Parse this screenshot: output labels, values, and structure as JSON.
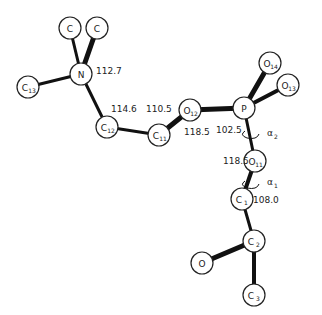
{
  "diagram": {
    "type": "molecular-structure",
    "atoms": [
      {
        "id": "Ca",
        "label": "C",
        "sub": "",
        "x": 70,
        "y": 28
      },
      {
        "id": "Cb",
        "label": "C",
        "sub": "",
        "x": 97,
        "y": 28
      },
      {
        "id": "N",
        "label": "N",
        "sub": "",
        "x": 81,
        "y": 74
      },
      {
        "id": "C13",
        "label": "C",
        "sub": "13",
        "x": 28,
        "y": 87
      },
      {
        "id": "C12",
        "label": "C",
        "sub": "12",
        "x": 107,
        "y": 127
      },
      {
        "id": "C11",
        "label": "C",
        "sub": "11",
        "x": 159,
        "y": 135
      },
      {
        "id": "O12",
        "label": "O",
        "sub": "12",
        "x": 190,
        "y": 110
      },
      {
        "id": "P",
        "label": "P",
        "sub": "",
        "x": 244,
        "y": 108
      },
      {
        "id": "O14",
        "label": "O",
        "sub": "14",
        "x": 270,
        "y": 63
      },
      {
        "id": "O13",
        "label": "O",
        "sub": "13",
        "x": 288,
        "y": 85
      },
      {
        "id": "O11",
        "label": "O",
        "sub": "11",
        "x": 255,
        "y": 161
      },
      {
        "id": "C1",
        "label": "C",
        "sub": "1",
        "x": 242,
        "y": 199
      },
      {
        "id": "C2",
        "label": "C",
        "sub": "2",
        "x": 254,
        "y": 241
      },
      {
        "id": "O",
        "label": "O",
        "sub": "",
        "x": 202,
        "y": 263
      },
      {
        "id": "C3",
        "label": "C",
        "sub": "3",
        "x": 254,
        "y": 295
      }
    ],
    "bond_angles": [
      {
        "value": "112.7",
        "x": 96,
        "y": 74
      },
      {
        "value": "114.6",
        "x": 111,
        "y": 112
      },
      {
        "value": "110.5",
        "x": 146,
        "y": 112
      },
      {
        "value": "118.5",
        "x": 184,
        "y": 135
      },
      {
        "value": "102.5",
        "x": 216,
        "y": 133
      },
      {
        "value": "118.5",
        "x": 223,
        "y": 164
      },
      {
        "value": "108.0",
        "x": 253,
        "y": 203
      }
    ],
    "torsions": [
      {
        "label": "α",
        "sub": "2",
        "x": 267,
        "y": 136
      },
      {
        "label": "α",
        "sub": "1",
        "x": 267,
        "y": 185
      }
    ]
  }
}
